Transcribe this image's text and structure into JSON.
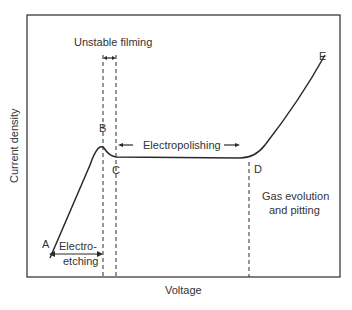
{
  "diagram": {
    "axes": {
      "x_label": "Voltage",
      "y_label": "Current density"
    },
    "points": [
      {
        "id": "A",
        "label": "A"
      },
      {
        "id": "B",
        "label": "B"
      },
      {
        "id": "C",
        "label": "C"
      },
      {
        "id": "D",
        "label": "D"
      },
      {
        "id": "E",
        "label": "E"
      }
    ],
    "regions": {
      "unstable_filming": "Unstable filming",
      "electropolishing": "Electropolishing",
      "electro_etching_line1": "Electro-",
      "electro_etching_line2": "etching",
      "gas_evolution_line1": "Gas evolution",
      "gas_evolution_line2": "and pitting"
    },
    "colors": {
      "line": "#2a2a2a",
      "text": "#333333",
      "background": "#ffffff"
    }
  }
}
